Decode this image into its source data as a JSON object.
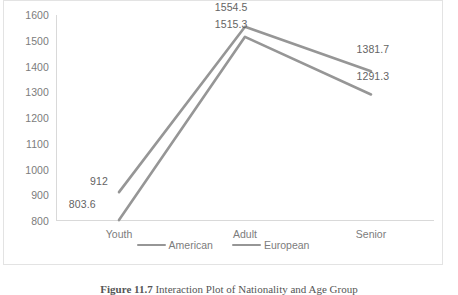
{
  "chart_data": {
    "type": "line",
    "title": "",
    "xlabel": "",
    "ylabel": "",
    "categories": [
      "Youth",
      "Adult",
      "Senior"
    ],
    "series": [
      {
        "name": "American",
        "values": [
          912,
          1554.5,
          1381.7
        ],
        "labels": [
          "912",
          "1554.5",
          "1381.7"
        ],
        "color": "#969696"
      },
      {
        "name": "European",
        "values": [
          803.6,
          1515.3,
          1291.3
        ],
        "labels": [
          "803.6",
          "1515.3",
          "1291.3"
        ],
        "color": "#969696"
      }
    ],
    "ylim": [
      800,
      1600
    ],
    "ytick_step": 100,
    "yticks": [
      "1600",
      "1500",
      "1400",
      "1300",
      "1200",
      "1100",
      "1000",
      "900",
      "800"
    ],
    "grid": false,
    "legend_position": "bottom",
    "markers": false
  },
  "legend": {
    "items": [
      {
        "label": "American"
      },
      {
        "label": "European"
      }
    ]
  },
  "caption": {
    "figure_label": "Figure 11.7",
    "text": "Interaction Plot of Nationality and Age Group"
  }
}
